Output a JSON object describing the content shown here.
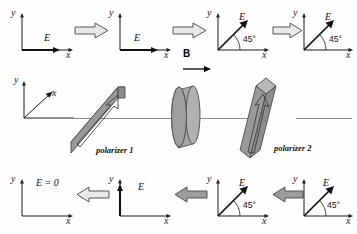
{
  "figure": {
    "axis_x": "x",
    "axis_y": "y",
    "field_label": "E",
    "field_zero_label": "E = 0",
    "angle_label": "45°",
    "b_field_label": "B",
    "polarizer1_label": "polarizer 1",
    "polarizer2_label": "polarizer 2",
    "colors": {
      "ink": "#1a1a1a",
      "slab_fill": "#9a9a9a",
      "slab_edge": "#4a4a4a",
      "slab_top": "#b8b8b8",
      "beam": "#8a8a8a",
      "arrow_fill": "#e8e8e8",
      "arrow_edge": "#555555"
    }
  },
  "rows": {
    "forward": {
      "direction": "right",
      "panels": [
        {
          "id": "f1",
          "axes": "2d",
          "field_label": "E",
          "field_orientation": "x",
          "angle": null
        },
        {
          "id": "f2",
          "axes": "2d",
          "field_label": "E",
          "field_orientation": "x",
          "angle": null
        },
        {
          "id": "f3",
          "axes": "2d",
          "field_label": "E",
          "field_orientation": "45",
          "angle": "45°"
        },
        {
          "id": "f4",
          "axes": "2d",
          "field_label": "E",
          "field_orientation": "45",
          "angle": "45°"
        }
      ],
      "arrows": 3
    },
    "apparatus": {
      "axes_label_x": "x",
      "axes_label_y": "y",
      "b_field_label": "B",
      "elements": [
        {
          "id": "polarizer1",
          "label": "polarizer 1",
          "type": "slab",
          "tilt": "horizontal-transmission"
        },
        {
          "id": "rotator",
          "label": "",
          "type": "cylinder"
        },
        {
          "id": "polarizer2",
          "label": "polarizer 2",
          "type": "slab",
          "tilt": "45-transmission"
        }
      ]
    },
    "backward": {
      "direction": "left",
      "panels": [
        {
          "id": "b1",
          "axes": "2d",
          "field_label": "E = 0",
          "field_orientation": "none",
          "angle": null
        },
        {
          "id": "b2",
          "axes": "2d",
          "field_label": "E",
          "field_orientation": "y",
          "angle": null
        },
        {
          "id": "b3",
          "axes": "2d",
          "field_label": "E",
          "field_orientation": "45",
          "angle": "45°"
        },
        {
          "id": "b4",
          "axes": "2d",
          "field_label": "E",
          "field_orientation": "45",
          "angle": "45°"
        }
      ],
      "arrows": 3
    }
  }
}
